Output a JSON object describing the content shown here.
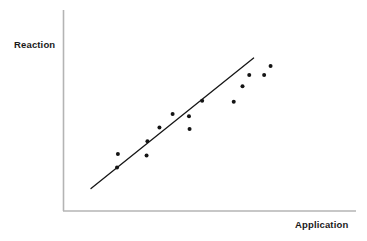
{
  "chart_data": {
    "type": "scatter",
    "title": "",
    "subtitle": "",
    "xlabel": "Application",
    "ylabel": "Reaction",
    "grid": false,
    "legend": null,
    "annotations": [],
    "axis": {
      "x_ticks": [],
      "y_ticks": [],
      "xlim": [
        0,
        100
      ],
      "ylim": [
        0,
        100
      ],
      "spines": [
        "left",
        "bottom"
      ],
      "color": "#b4b4b4"
    },
    "series": [
      {
        "name": "observations",
        "type": "scatter",
        "marker": "circle",
        "marker_color": "#141414",
        "marker_size": 4,
        "points": [
          {
            "x": 18.6,
            "y": 28.4
          },
          {
            "x": 18.3,
            "y": 21.6
          },
          {
            "x": 28.4,
            "y": 27.6
          },
          {
            "x": 28.7,
            "y": 34.7
          },
          {
            "x": 32.8,
            "y": 41.6
          },
          {
            "x": 37.3,
            "y": 48.2
          },
          {
            "x": 42.9,
            "y": 47.2
          },
          {
            "x": 43.1,
            "y": 40.8
          },
          {
            "x": 47.4,
            "y": 54.8
          },
          {
            "x": 58.2,
            "y": 54.3
          },
          {
            "x": 61.2,
            "y": 62.1
          },
          {
            "x": 63.5,
            "y": 67.6
          },
          {
            "x": 68.6,
            "y": 67.6
          },
          {
            "x": 70.8,
            "y": 72.1
          }
        ]
      },
      {
        "name": "trend-line",
        "type": "line",
        "line_color": "#161616",
        "line_width": 1.3,
        "points": [
          {
            "x": 9.4,
            "y": 11.2
          },
          {
            "x": 65.0,
            "y": 76.1
          }
        ]
      }
    ]
  },
  "labels": {
    "y_axis_title": "Reaction",
    "x_axis_title": "Application"
  }
}
